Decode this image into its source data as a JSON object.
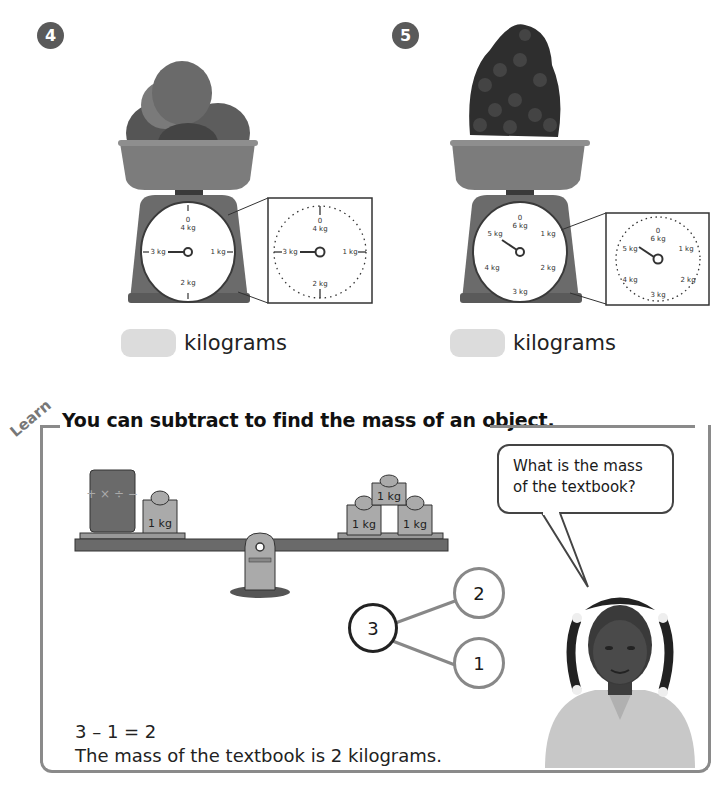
{
  "questions": [
    {
      "number": "4",
      "item": "apples",
      "scale": {
        "labels": [
          "0",
          "4 kg",
          "1 kg",
          "2 kg",
          "3 kg"
        ],
        "max_kg": 4,
        "reading_kg": 3
      },
      "answer": {
        "value": "",
        "unit": "kilograms"
      }
    },
    {
      "number": "5",
      "item": "grapes",
      "scale": {
        "labels": [
          "0",
          "6 kg",
          "1 kg",
          "2 kg",
          "3 kg",
          "4 kg",
          "5 kg"
        ],
        "max_kg": 6,
        "reading_kg": 5
      },
      "answer": {
        "value": "",
        "unit": "kilograms"
      }
    }
  ],
  "learn": {
    "tag": "Learn",
    "heading": "You can subtract to find the mass of an object.",
    "balance": {
      "left_weight": "1 kg",
      "right_weights": [
        "1 kg",
        "1 kg",
        "1 kg"
      ],
      "book_symbols": "+ × ÷ −"
    },
    "speech_bubble": "What is the mass of the textbook?",
    "number_bond": {
      "whole": "3",
      "part1": "2",
      "part2": "1"
    },
    "equation": "3 – 1 = 2",
    "conclusion": "The mass of the textbook is 2 kilograms."
  }
}
